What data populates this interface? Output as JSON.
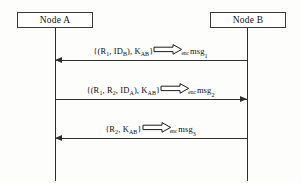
{
  "diagram": {
    "type": "sequence-diagram",
    "participants": [
      {
        "id": "node-a",
        "label": "Node A"
      },
      {
        "id": "node-b",
        "label": "Node B"
      }
    ],
    "messages": [
      {
        "index": 1,
        "from": "node-b",
        "to": "node-a",
        "direction": "left",
        "payload": "{(R",
        "payload_full": "{(R1, IDB), KAB}",
        "parts": {
          "open": "{(R",
          "sub1": "1",
          "mid": ", ID",
          "sub2": "B",
          "close": "), K",
          "sub3": "AB",
          "end": "}"
        },
        "operator_subscript": "enc",
        "result": "msg",
        "result_subscript": "1"
      },
      {
        "index": 2,
        "from": "node-a",
        "to": "node-b",
        "direction": "right",
        "payload_full": "{(R1, R2, IDA), KAB}",
        "parts": {
          "open": "{(R",
          "sub1": "1",
          "mid": ", R",
          "sub2": "2",
          "mid2": ", ID",
          "sub3": "A",
          "close": "), K",
          "sub4": "AB",
          "end": "}"
        },
        "operator_subscript": "enc",
        "result": "msg",
        "result_subscript": "2"
      },
      {
        "index": 3,
        "from": "node-b",
        "to": "node-a",
        "direction": "left",
        "payload_full": "{R2, KAB}",
        "parts": {
          "open": "{R",
          "sub1": "2",
          "close": ", K",
          "sub2": "AB",
          "end": "}"
        },
        "operator_subscript": "enc",
        "result": "msg",
        "result_subscript": "3"
      }
    ],
    "colors": {
      "line": "#2e2e2e",
      "box_border": "#3a3a3a",
      "background": "#fdfdfc",
      "text": "#101010"
    }
  }
}
